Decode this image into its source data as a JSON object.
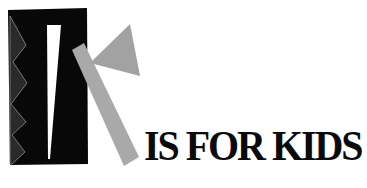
{
  "logo": {
    "letter": "K",
    "headline": "IS FOR KIDS",
    "colors": {
      "block": "#080808",
      "zigzag": "#2a2a2a",
      "zigzag_edge": "#9a9a9a",
      "sliver": "#ffffff",
      "bar": "#a9a9a9",
      "triangle": "#a2a2a2",
      "text": "#0a0a0a"
    }
  }
}
